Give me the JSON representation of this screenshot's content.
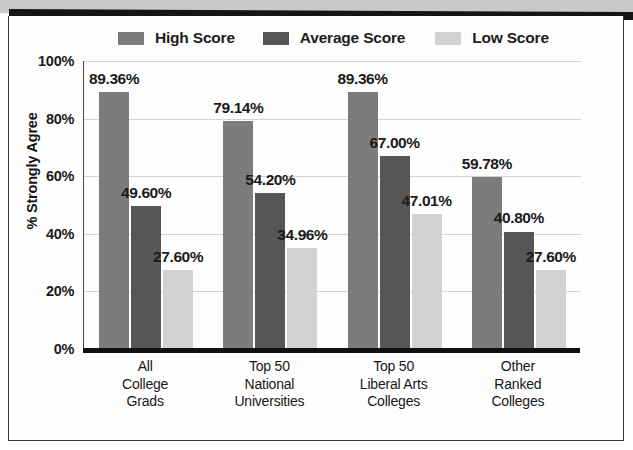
{
  "chart_data": {
    "type": "bar",
    "title": "",
    "xlabel": "",
    "ylabel": "% Strongly Agree",
    "ylim": [
      0,
      100
    ],
    "yticks": [
      "0%",
      "20%",
      "40%",
      "60%",
      "80%",
      "100%"
    ],
    "ytick_values": [
      0,
      20,
      40,
      60,
      80,
      100
    ],
    "grid": true,
    "legend_position": "top",
    "categories": [
      "All College Grads",
      "Top 50 National Universities",
      "Top 50 Liberal Arts Colleges",
      "Other Ranked Colleges"
    ],
    "category_lines": [
      [
        "All",
        "College",
        "Grads"
      ],
      [
        "Top 50",
        "National",
        "Universities"
      ],
      [
        "Top 50",
        "Liberal Arts",
        "Colleges"
      ],
      [
        "Other",
        "Ranked",
        "Colleges"
      ]
    ],
    "series": [
      {
        "name": "High Score",
        "color": "#7c7c7c",
        "values": [
          89.36,
          79.14,
          89.36,
          59.78
        ],
        "labels": [
          "89.36%",
          "79.14%",
          "89.36%",
          "59.78%"
        ]
      },
      {
        "name": "Average Score",
        "color": "#565656",
        "values": [
          49.6,
          54.2,
          67.0,
          40.8
        ],
        "labels": [
          "49.60%",
          "54.20%",
          "67.00%",
          "40.80%"
        ]
      },
      {
        "name": "Low Score",
        "color": "#d2d2d2",
        "values": [
          27.6,
          34.96,
          47.01,
          27.6
        ],
        "labels": [
          "27.60%",
          "34.96%",
          "47.01%",
          "27.60%"
        ]
      }
    ]
  },
  "legend": {
    "items": [
      {
        "label": "High Score",
        "color": "#7c7c7c"
      },
      {
        "label": "Average Score",
        "color": "#565656"
      },
      {
        "label": "Low Score",
        "color": "#d2d2d2"
      }
    ]
  },
  "axis": {
    "y_title": "% Strongly Agree"
  },
  "colors": {
    "high": "#7c7c7c",
    "average": "#565656",
    "low": "#d2d2d2",
    "grid": "#d5d5d5",
    "axis": "#111111",
    "text": "#1a1a1a"
  }
}
